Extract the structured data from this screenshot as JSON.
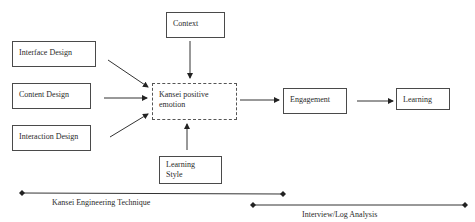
{
  "diagram": {
    "inputs": [
      {
        "label": "Interface Design"
      },
      {
        "label": "Content Design"
      },
      {
        "label": "Interaction Design"
      }
    ],
    "context": {
      "label": "Context"
    },
    "center": {
      "label_line1": "Kansei positive",
      "label_line2": "emotion"
    },
    "learning_style": {
      "label_line1": "Learning",
      "label_line2": "Style"
    },
    "engagement": {
      "label": "Engagement"
    },
    "learning": {
      "label": "Learning"
    },
    "phases": [
      {
        "label": "Kansei Engineering Technique"
      },
      {
        "label": "Interview/Log Analysis"
      }
    ],
    "colors": {
      "line": "#2a2a2a",
      "box_border": "#4a4a4a"
    }
  }
}
